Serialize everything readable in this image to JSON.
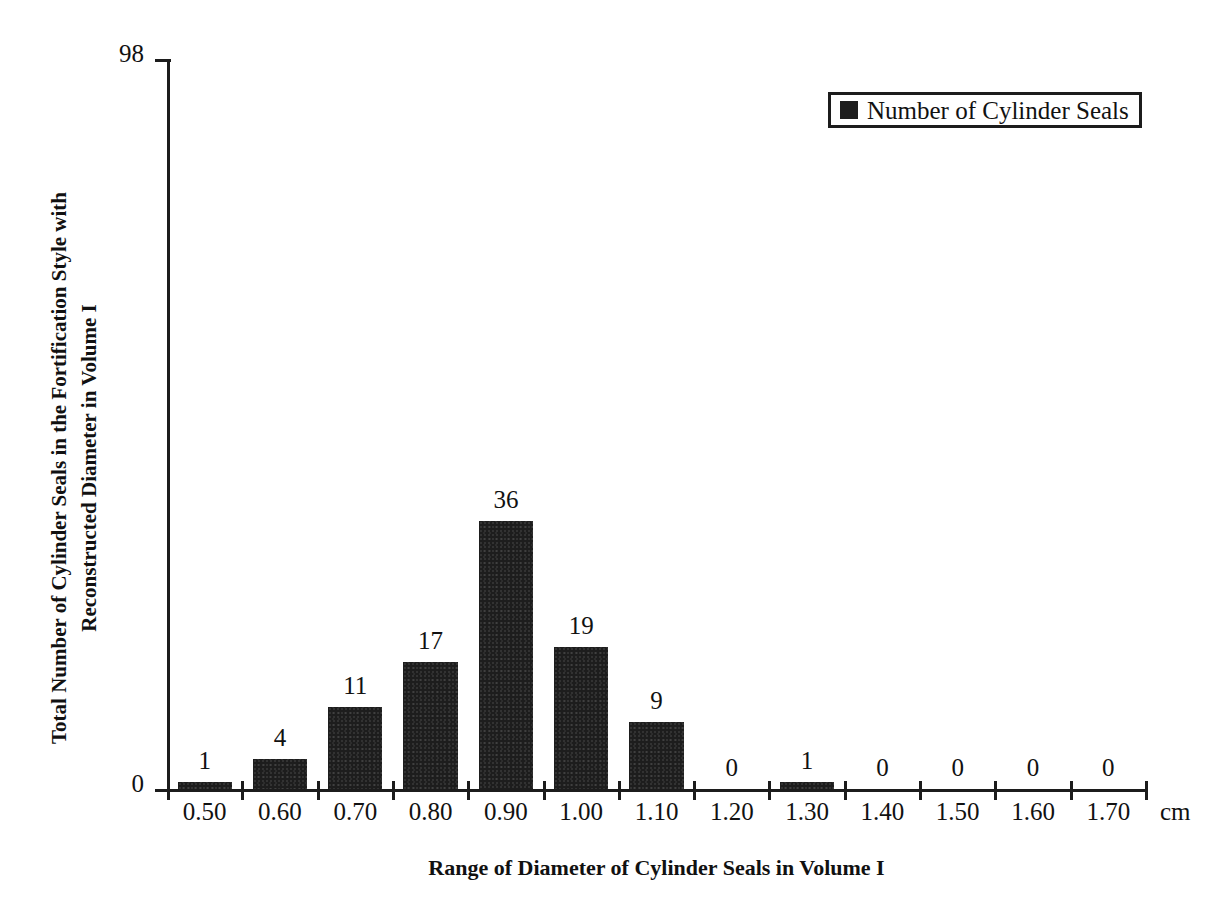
{
  "chart_data": {
    "type": "bar",
    "title": "",
    "xlabel": "Range of Diameter of Cylinder Seals in Volume I",
    "ylabel_line1": "Total Number of Cylinder Seals in the Fortification Style with",
    "ylabel_line2": "Reconstructed Diameter in Volume I",
    "x_unit": "cm",
    "categories": [
      "0.50",
      "0.60",
      "0.70",
      "0.80",
      "0.90",
      "1.00",
      "1.10",
      "1.20",
      "1.30",
      "1.40",
      "1.50",
      "1.60",
      "1.70"
    ],
    "values": [
      1,
      4,
      11,
      17,
      36,
      19,
      9,
      0,
      1,
      0,
      0,
      0,
      0
    ],
    "series": [
      {
        "name": "Number of Cylinder Seals",
        "values": [
          1,
          4,
          11,
          17,
          36,
          19,
          9,
          0,
          1,
          0,
          0,
          0,
          0
        ]
      }
    ],
    "ylim": [
      0,
      98
    ],
    "y_tick_labels": [
      "0",
      "98"
    ],
    "grid": false,
    "legend_position": "top-right",
    "bar_color": "#1d1d1d",
    "axis_color": "#1c1c1c",
    "show_value_labels": true
  },
  "legend": {
    "entries": [
      {
        "label": "Number of Cylinder Seals",
        "color": "#1d1d1d"
      }
    ]
  }
}
